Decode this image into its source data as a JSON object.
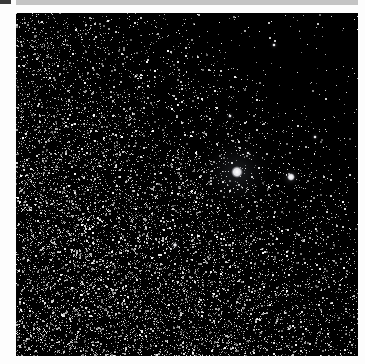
{
  "image": {
    "alt": "Starfield astrophotograph with a bright star surrounded by faint nebulosity",
    "width": 342,
    "height": 343,
    "background": "#000000",
    "seed": 20240517,
    "star_count": 9000,
    "density_gradient": {
      "description": "dense lower-left, sparse dark upper-right",
      "dense_corner": [
        0,
        1
      ],
      "sparse_corner": [
        1,
        0.15
      ]
    },
    "bright_stars": [
      {
        "x": 221,
        "y": 159,
        "radius": 6,
        "glow": 38,
        "glow_color": "rgba(170,180,200,0.18)"
      },
      {
        "x": 275,
        "y": 164,
        "radius": 4,
        "glow": 10,
        "glow_color": "rgba(220,220,230,0.25)"
      },
      {
        "x": 159,
        "y": 232,
        "radius": 2.2,
        "glow": 6,
        "glow_color": "rgba(220,220,230,0.2)"
      },
      {
        "x": 214,
        "y": 103,
        "radius": 1.8,
        "glow": 5,
        "glow_color": "rgba(220,220,230,0.2)"
      },
      {
        "x": 258,
        "y": 32,
        "radius": 1.8,
        "glow": 5,
        "glow_color": "rgba(220,220,230,0.2)"
      },
      {
        "x": 299,
        "y": 124,
        "radius": 1.8,
        "glow": 5,
        "glow_color": "rgba(220,220,230,0.2)"
      },
      {
        "x": 232,
        "y": 140,
        "radius": 1.5,
        "glow": 4,
        "glow_color": "rgba(220,220,230,0.2)"
      }
    ]
  },
  "chrome": {
    "top_bar_color": "#c4c4c4",
    "corner_block_color": "#3a3a3a"
  }
}
